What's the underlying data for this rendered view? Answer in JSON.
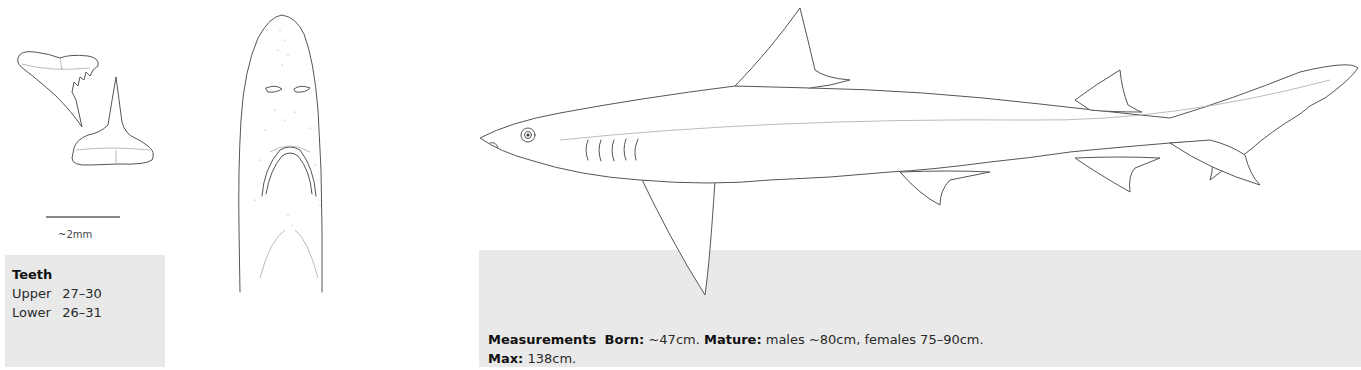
{
  "teeth_figure": {
    "scale_label": "~2mm"
  },
  "teeth_box": {
    "title": "Teeth",
    "rows": [
      {
        "label": "Upper",
        "value": "27–30"
      },
      {
        "label": "Lower",
        "value": "26–31"
      }
    ]
  },
  "measurements_box": {
    "title": "Measurements",
    "born_label": "Born:",
    "born_value": "~47cm.",
    "mature_label": "Mature:",
    "mature_value": "males ~80cm, females 75–90cm.",
    "max_label": "Max:",
    "max_value": "138cm."
  },
  "illustrations": {
    "teeth": "upper-and-lower-teeth-drawing",
    "head": "ventral-head-view-drawing",
    "body": "lateral-shark-drawing"
  },
  "colors": {
    "box_background": "#e9e9e9",
    "ink": "#555555",
    "text": "#2a2a2a"
  }
}
